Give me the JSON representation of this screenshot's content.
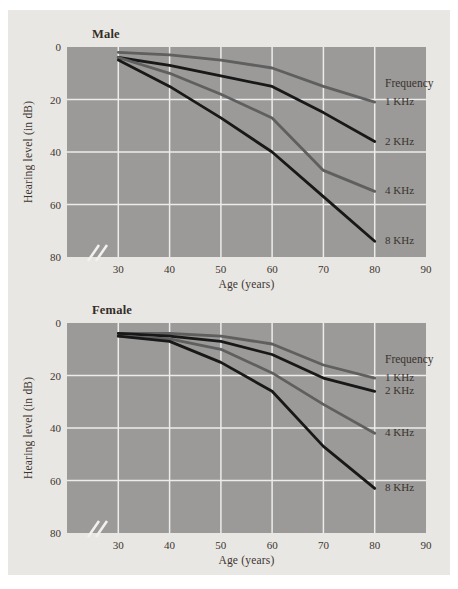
{
  "figure": {
    "panel_color": "#e9e7e3",
    "plot_background": "#9b9a98",
    "gridline_color": "#ececec",
    "text_color": "#3c3530",
    "line_colors": {
      "gray": "#5f5f5f",
      "black": "#181818"
    }
  },
  "chart_data": [
    {
      "type": "line",
      "title": "Male",
      "xlabel": "Age (years)",
      "ylabel": "Hearing level (in dB)",
      "legend_title": "Frequency",
      "legend_position": "right-inside",
      "grid": true,
      "y_axis_direction": "increases-downward",
      "axis_break_bottom_left": true,
      "x": [
        30,
        40,
        50,
        60,
        70,
        80
      ],
      "xticks": [
        "30",
        "40",
        "50",
        "60",
        "70",
        "80",
        "90"
      ],
      "yticks": [
        "0",
        "20",
        "40",
        "60",
        "80"
      ],
      "xlim": [
        20,
        90
      ],
      "ylim": [
        0,
        80
      ],
      "series": [
        {
          "name": "1 KHz",
          "color": "#5f5f5f",
          "values": [
            2,
            3,
            5,
            8,
            15,
            21
          ]
        },
        {
          "name": "2 KHz",
          "color": "#181818",
          "values": [
            4,
            7,
            11,
            15,
            25,
            36
          ]
        },
        {
          "name": "4 KHz",
          "color": "#5f5f5f",
          "values": [
            4,
            10,
            18,
            27,
            47,
            55
          ]
        },
        {
          "name": "8 KHz",
          "color": "#181818",
          "values": [
            5,
            15,
            27,
            40,
            57,
            74
          ]
        }
      ]
    },
    {
      "type": "line",
      "title": "Female",
      "xlabel": "Age (years)",
      "ylabel": "Hearing level (in dB)",
      "legend_title": "Frequency",
      "legend_position": "right-inside",
      "grid": true,
      "y_axis_direction": "increases-downward",
      "axis_break_bottom_left": true,
      "x": [
        30,
        40,
        50,
        60,
        70,
        80
      ],
      "xticks": [
        "30",
        "40",
        "50",
        "60",
        "70",
        "80",
        "90"
      ],
      "yticks": [
        "0",
        "20",
        "40",
        "60",
        "80"
      ],
      "xlim": [
        20,
        90
      ],
      "ylim": [
        0,
        80
      ],
      "series": [
        {
          "name": "1 KHz",
          "color": "#5f5f5f",
          "values": [
            4,
            4,
            5,
            8,
            16,
            21
          ]
        },
        {
          "name": "2 KHz",
          "color": "#181818",
          "values": [
            4,
            5,
            7,
            12,
            21,
            26
          ]
        },
        {
          "name": "4 KHz",
          "color": "#5f5f5f",
          "values": [
            5,
            6,
            10,
            19,
            31,
            42
          ]
        },
        {
          "name": "8 KHz",
          "color": "#181818",
          "values": [
            5,
            7,
            15,
            26,
            47,
            63
          ]
        }
      ]
    }
  ]
}
